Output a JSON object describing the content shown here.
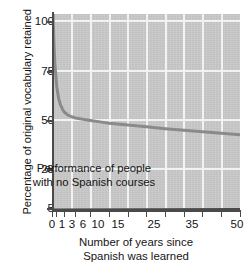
{
  "chart_data": {
    "type": "line",
    "title": "",
    "xlabel": "Number of years since Spanish was learned",
    "ylabel": "Percentage of original vocabulary retained",
    "xlim": [
      0,
      50
    ],
    "ylim": [
      5,
      100
    ],
    "grid": true,
    "legend": null,
    "x_ticks": [
      0,
      1,
      3,
      6,
      10,
      15,
      25,
      35,
      50
    ],
    "x_tick_labels": [
      "0",
      "1",
      "3",
      "6",
      "10",
      "15",
      "25",
      "35",
      "50"
    ],
    "y_ticks": [
      5,
      25,
      50,
      75,
      100
    ],
    "y_tick_labels": [
      "5",
      "25",
      "50",
      "75",
      "100"
    ],
    "series": [
      {
        "name": "Retention curve",
        "color": "#8a8a8a",
        "x": [
          0,
          0.25,
          0.5,
          0.75,
          1,
          1.5,
          2,
          2.5,
          3,
          4,
          5,
          6,
          8,
          10,
          13,
          15,
          20,
          25,
          30,
          35,
          40,
          45,
          50
        ],
        "values": [
          100,
          86,
          76,
          70,
          65,
          59,
          56,
          54,
          52.5,
          51,
          50.2,
          49.6,
          49.0,
          48.4,
          47.6,
          47.1,
          46.2,
          45.3,
          44.4,
          43.6,
          42.9,
          42.2,
          41.5
        ]
      },
      {
        "name": "Performance of people with no Spanish courses",
        "color": "#4a4a4a",
        "x": [
          0,
          50
        ],
        "values": [
          5,
          5.2
        ]
      }
    ],
    "annotations": [
      {
        "text_lines": [
          "Performance of people",
          "with no Spanish courses"
        ],
        "x": 22,
        "y": 16
      }
    ]
  },
  "axes": {
    "y_title": "Percentage of original vocabulary retained",
    "x_title_line1": "Number of years since",
    "x_title_line2": "Spanish was learned"
  },
  "annotation": {
    "line1": "Performance of people",
    "line2": "with no Spanish courses"
  },
  "colors": {
    "plot_background": "#c9c9c9",
    "gridline": "#f2f2f2",
    "axis": "#4a4a4a",
    "curve": "#8a8a8a",
    "baseline": "#4a4a4a",
    "text": "#141414",
    "page_background": "#ffffff"
  }
}
